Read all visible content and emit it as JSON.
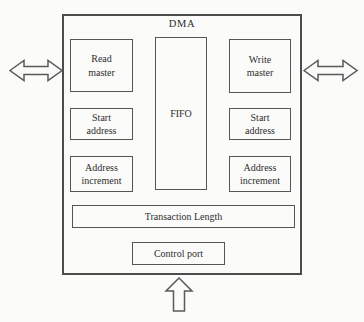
{
  "figure": {
    "title": "DMA",
    "blocks": {
      "read_master": {
        "label": "Read\nmaster"
      },
      "write_master": {
        "label": "Write\nmaster"
      },
      "fifo": {
        "label": "FIFO"
      },
      "start_address_left": {
        "label": "Start\naddress"
      },
      "start_address_right": {
        "label": "Start\naddress"
      },
      "address_increment_left": {
        "label": "Address\nincrement"
      },
      "address_increment_right": {
        "label": "Address\nincrement"
      },
      "transaction_length": {
        "label": "Transaction Length"
      },
      "control_port": {
        "label": "Control port"
      }
    },
    "icons": {
      "left_port": "bidirectional-arrow",
      "right_port": "bidirectional-arrow",
      "bottom_port": "up-arrow"
    },
    "colors": {
      "line": "#4c4c4c",
      "background": "#fbfbfa",
      "text": "#2e2e2e"
    }
  }
}
